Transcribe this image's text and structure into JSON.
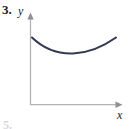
{
  "figure": {
    "problem_number": "3.",
    "y_axis_label": "y",
    "x_axis_label": "x",
    "bottom_cutoff_text": "5.",
    "curve_color": "#343a54",
    "axis_color": "#b2b2b8",
    "background_color": "#ffffff",
    "text_color": "#1a1a28"
  },
  "chart_data": {
    "type": "line",
    "title": "",
    "subtitle": "",
    "xlabel": "x",
    "ylabel": "y",
    "grid": false,
    "legend": null,
    "axis_style": "arrow-headed first-quadrant axes",
    "xlim": [
      0,
      100
    ],
    "ylim": [
      0,
      100
    ],
    "series": [
      {
        "name": "curve",
        "x": [
          3,
          12,
          22,
          32,
          42,
          52,
          62,
          72,
          82,
          92,
          100
        ],
        "y": [
          79,
          74,
          70,
          67,
          66,
          66,
          67,
          70,
          73,
          77,
          80
        ]
      }
    ],
    "curve_path": "M 32,37.5 C 45,50 58,54 73,53.5 C 90,53 104,46 116,37.5"
  }
}
